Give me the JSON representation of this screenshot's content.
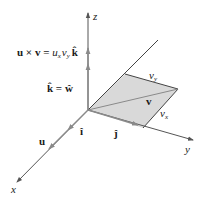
{
  "diagram": {
    "type": "3d-vector-cross-product",
    "axes": {
      "x": {
        "label": "x"
      },
      "y": {
        "label": "y"
      },
      "z": {
        "label": "z"
      }
    },
    "labels": {
      "cross_product_lhs": "u × v = ",
      "cross_product_ux": "u",
      "cross_product_ux_sub": "x",
      "cross_product_vy": "v",
      "cross_product_vy_sub": "y",
      "cross_product_k": "k̂",
      "k_eq_w": "k̂ = ŵ",
      "v_vector": "v",
      "v_y": "v",
      "v_y_sub": "y",
      "v_x": "v",
      "v_x_sub": "x",
      "i_hat": "î",
      "j_hat": "ĵ",
      "u_vector": "u"
    },
    "colors": {
      "axis": "#555555",
      "vector_arrow": "#8a8a8a",
      "parallelogram_fill": "#d9d9d9",
      "parallelogram_edge": "#444444",
      "text": "#1a1a1a"
    }
  }
}
